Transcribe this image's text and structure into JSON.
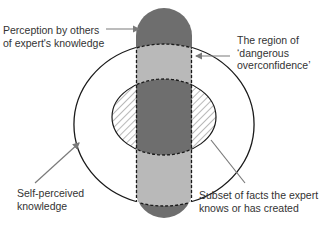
{
  "diagram": {
    "type": "venn-style knowledge diagram",
    "colors": {
      "background": "#ffffff",
      "pill_dark": "#6e6e6e",
      "pill_light": "#b9b9b9",
      "outline": "#1a1a1a",
      "arrow": "#7a7a7a",
      "hatch": "#8a8a8a",
      "text": "#333333"
    },
    "labels": {
      "perception": {
        "line1": "Perception by others",
        "line2": "of expert's knowledge"
      },
      "overconfidence": {
        "line1": "The region of",
        "line2": "‘dangerous",
        "line3": "overconfidence’"
      },
      "self_perceived": {
        "line1": "Self-perceived",
        "line2": "knowledge"
      },
      "subset": {
        "line1": "Subset of facts the expert",
        "line2": "knows or has created"
      }
    },
    "shapes": [
      {
        "name": "perception-by-others-pill",
        "fill": "dark gray with light gray bands inside outer ellipse"
      },
      {
        "name": "self-perceived-knowledge-ellipse",
        "style": "solid outline"
      },
      {
        "name": "subset-of-facts-ellipse",
        "style": "hatched fill outside pill"
      }
    ]
  }
}
